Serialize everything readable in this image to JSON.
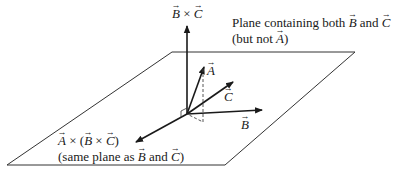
{
  "diagram": {
    "plane": {
      "caption_line1": [
        "Plane containing both ",
        "B",
        " and ",
        "C"
      ],
      "caption_line2": [
        "(but not ",
        "A",
        ")"
      ],
      "corners": [
        [
          172,
          52
        ],
        [
          355,
          52
        ],
        [
          225,
          165
        ],
        [
          7,
          165
        ]
      ]
    },
    "origin": [
      187,
      114
    ],
    "vectors": {
      "A": {
        "label": "A",
        "tip": [
          204,
          66
        ]
      },
      "B": {
        "label": "B",
        "tip": [
          262,
          110
        ]
      },
      "C": {
        "label": "C",
        "tip": [
          233,
          81
        ]
      },
      "BxC": {
        "label_parts": [
          "B",
          " × ",
          "C"
        ],
        "tip": [
          187,
          25
        ]
      },
      "AxBxC": {
        "label_parts": [
          "A",
          " × (",
          "B",
          " × ",
          "C",
          ")"
        ],
        "tip": [
          135,
          143
        ],
        "note_parts": [
          "(same plane as ",
          "B",
          " and ",
          "C",
          ")"
        ]
      }
    },
    "projection": {
      "style": "dashed",
      "from": [
        203,
        68
      ],
      "to": [
        203,
        122
      ]
    },
    "right_angle_marker": true,
    "colors": {
      "line": "#1a1a1a",
      "plane": "#333333",
      "background": "#ffffff"
    }
  }
}
